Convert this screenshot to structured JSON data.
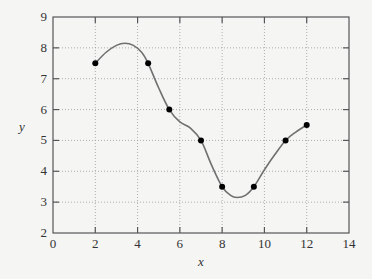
{
  "chart_data": {
    "type": "line",
    "title": "",
    "xlabel": "x",
    "ylabel": "y",
    "xlim": [
      0,
      14
    ],
    "ylim": [
      2,
      9
    ],
    "x_ticks": [
      0,
      2,
      4,
      6,
      8,
      10,
      12,
      14
    ],
    "y_ticks": [
      2,
      3,
      4,
      5,
      6,
      7,
      8,
      9
    ],
    "grid": true,
    "grid_style": "dotted",
    "legend": null,
    "series": [
      {
        "name": "data points",
        "style": "markers",
        "x": [
          2,
          4.5,
          5.5,
          7,
          8,
          9.5,
          11,
          12
        ],
        "y": [
          7.5,
          7.5,
          6,
          5,
          3.5,
          3.5,
          5,
          5.5
        ]
      },
      {
        "name": "interpolating curve",
        "style": "smooth-line",
        "x": [
          2,
          2.5,
          3,
          3.4,
          3.8,
          4.2,
          4.5,
          5.0,
          5.5,
          6.0,
          6.5,
          7.0,
          7.5,
          8.0,
          8.4,
          8.7,
          9.1,
          9.5,
          10.0,
          10.5,
          11.0,
          11.5,
          12.0
        ],
        "y": [
          7.5,
          7.85,
          8.08,
          8.15,
          8.08,
          7.85,
          7.5,
          6.7,
          6.0,
          5.6,
          5.4,
          5.0,
          4.2,
          3.5,
          3.22,
          3.15,
          3.22,
          3.5,
          4.05,
          4.55,
          5.0,
          5.28,
          5.5
        ]
      }
    ],
    "colors": {
      "background": "#f5f5f4",
      "axes": "#555555",
      "grid": "#9a9a9a",
      "curve": "#707070",
      "markers": "#000000"
    }
  }
}
